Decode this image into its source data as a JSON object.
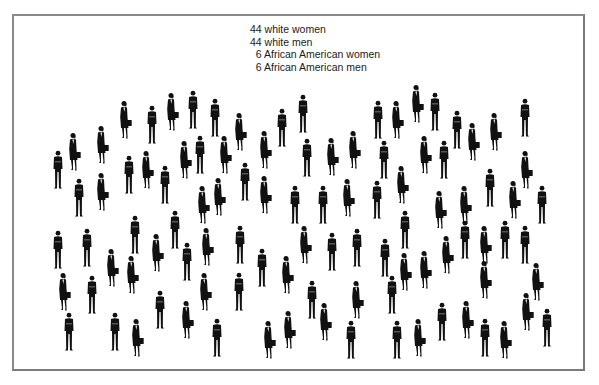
{
  "legend": {
    "lines": [
      "44 white women",
      "44 white men",
      "  6 African American women",
      "  6 African American men"
    ]
  },
  "colors": {
    "figure": "#111111",
    "frame": "#808080",
    "background": "#ffffff",
    "text": "#1a1a1a"
  },
  "figures": [
    {
      "x": 51,
      "y": 150,
      "t": "m"
    },
    {
      "x": 67,
      "y": 132,
      "t": "w"
    },
    {
      "x": 72,
      "y": 178,
      "t": "m"
    },
    {
      "x": 95,
      "y": 125,
      "t": "w"
    },
    {
      "x": 95,
      "y": 172,
      "t": "w"
    },
    {
      "x": 118,
      "y": 100,
      "t": "w"
    },
    {
      "x": 122,
      "y": 155,
      "t": "m"
    },
    {
      "x": 140,
      "y": 150,
      "t": "w"
    },
    {
      "x": 145,
      "y": 105,
      "t": "m"
    },
    {
      "x": 158,
      "y": 165,
      "t": "m"
    },
    {
      "x": 165,
      "y": 92,
      "t": "w"
    },
    {
      "x": 178,
      "y": 140,
      "t": "w"
    },
    {
      "x": 186,
      "y": 90,
      "t": "m"
    },
    {
      "x": 193,
      "y": 135,
      "t": "m"
    },
    {
      "x": 208,
      "y": 98,
      "t": "m"
    },
    {
      "x": 218,
      "y": 135,
      "t": "w"
    },
    {
      "x": 233,
      "y": 112,
      "t": "w"
    },
    {
      "x": 238,
      "y": 162,
      "t": "m"
    },
    {
      "x": 258,
      "y": 130,
      "t": "w"
    },
    {
      "x": 275,
      "y": 108,
      "t": "m"
    },
    {
      "x": 296,
      "y": 94,
      "t": "m"
    },
    {
      "x": 300,
      "y": 138,
      "t": "m"
    },
    {
      "x": 325,
      "y": 137,
      "t": "w"
    },
    {
      "x": 347,
      "y": 130,
      "t": "w"
    },
    {
      "x": 371,
      "y": 100,
      "t": "m"
    },
    {
      "x": 377,
      "y": 140,
      "t": "m"
    },
    {
      "x": 390,
      "y": 100,
      "t": "w"
    },
    {
      "x": 410,
      "y": 84,
      "t": "w"
    },
    {
      "x": 428,
      "y": 92,
      "t": "m"
    },
    {
      "x": 450,
      "y": 110,
      "t": "m"
    },
    {
      "x": 466,
      "y": 122,
      "t": "w"
    },
    {
      "x": 488,
      "y": 112,
      "t": "w"
    },
    {
      "x": 518,
      "y": 98,
      "t": "m"
    },
    {
      "x": 418,
      "y": 135,
      "t": "w"
    },
    {
      "x": 437,
      "y": 140,
      "t": "m"
    },
    {
      "x": 196,
      "y": 185,
      "t": "w"
    },
    {
      "x": 212,
      "y": 177,
      "t": "w"
    },
    {
      "x": 258,
      "y": 175,
      "t": "w"
    },
    {
      "x": 288,
      "y": 185,
      "t": "m"
    },
    {
      "x": 316,
      "y": 185,
      "t": "m"
    },
    {
      "x": 341,
      "y": 178,
      "t": "w"
    },
    {
      "x": 370,
      "y": 180,
      "t": "m"
    },
    {
      "x": 395,
      "y": 165,
      "t": "w"
    },
    {
      "x": 433,
      "y": 190,
      "t": "w"
    },
    {
      "x": 458,
      "y": 185,
      "t": "w"
    },
    {
      "x": 483,
      "y": 168,
      "t": "m"
    },
    {
      "x": 507,
      "y": 180,
      "t": "w"
    },
    {
      "x": 519,
      "y": 150,
      "t": "w"
    },
    {
      "x": 535,
      "y": 185,
      "t": "m"
    },
    {
      "x": 398,
      "y": 210,
      "t": "m"
    },
    {
      "x": 51,
      "y": 230,
      "t": "m"
    },
    {
      "x": 80,
      "y": 228,
      "t": "m"
    },
    {
      "x": 105,
      "y": 248,
      "t": "w"
    },
    {
      "x": 125,
      "y": 255,
      "t": "w"
    },
    {
      "x": 128,
      "y": 215,
      "t": "m"
    },
    {
      "x": 150,
      "y": 233,
      "t": "w"
    },
    {
      "x": 168,
      "y": 210,
      "t": "m"
    },
    {
      "x": 180,
      "y": 242,
      "t": "m"
    },
    {
      "x": 200,
      "y": 227,
      "t": "w"
    },
    {
      "x": 233,
      "y": 225,
      "t": "m"
    },
    {
      "x": 255,
      "y": 248,
      "t": "m"
    },
    {
      "x": 280,
      "y": 255,
      "t": "w"
    },
    {
      "x": 298,
      "y": 225,
      "t": "w"
    },
    {
      "x": 325,
      "y": 232,
      "t": "m"
    },
    {
      "x": 350,
      "y": 228,
      "t": "m"
    },
    {
      "x": 378,
      "y": 238,
      "t": "m"
    },
    {
      "x": 398,
      "y": 252,
      "t": "w"
    },
    {
      "x": 418,
      "y": 250,
      "t": "w"
    },
    {
      "x": 440,
      "y": 235,
      "t": "w"
    },
    {
      "x": 458,
      "y": 220,
      "t": "m"
    },
    {
      "x": 478,
      "y": 225,
      "t": "w"
    },
    {
      "x": 498,
      "y": 220,
      "t": "m"
    },
    {
      "x": 518,
      "y": 225,
      "t": "m"
    },
    {
      "x": 530,
      "y": 262,
      "t": "w"
    },
    {
      "x": 478,
      "y": 260,
      "t": "w"
    },
    {
      "x": 57,
      "y": 272,
      "t": "w"
    },
    {
      "x": 62,
      "y": 312,
      "t": "m"
    },
    {
      "x": 85,
      "y": 275,
      "t": "m"
    },
    {
      "x": 108,
      "y": 312,
      "t": "m"
    },
    {
      "x": 130,
      "y": 318,
      "t": "w"
    },
    {
      "x": 153,
      "y": 290,
      "t": "m"
    },
    {
      "x": 180,
      "y": 300,
      "t": "w"
    },
    {
      "x": 198,
      "y": 272,
      "t": "w"
    },
    {
      "x": 210,
      "y": 318,
      "t": "m"
    },
    {
      "x": 232,
      "y": 272,
      "t": "m"
    },
    {
      "x": 262,
      "y": 320,
      "t": "w"
    },
    {
      "x": 282,
      "y": 310,
      "t": "w"
    },
    {
      "x": 305,
      "y": 280,
      "t": "m"
    },
    {
      "x": 318,
      "y": 302,
      "t": "w"
    },
    {
      "x": 344,
      "y": 320,
      "t": "m"
    },
    {
      "x": 350,
      "y": 280,
      "t": "w"
    },
    {
      "x": 385,
      "y": 275,
      "t": "m"
    },
    {
      "x": 390,
      "y": 320,
      "t": "m"
    },
    {
      "x": 412,
      "y": 318,
      "t": "w"
    },
    {
      "x": 435,
      "y": 302,
      "t": "m"
    },
    {
      "x": 460,
      "y": 300,
      "t": "w"
    },
    {
      "x": 478,
      "y": 318,
      "t": "m"
    },
    {
      "x": 498,
      "y": 320,
      "t": "w"
    },
    {
      "x": 520,
      "y": 292,
      "t": "w"
    },
    {
      "x": 540,
      "y": 308,
      "t": "m"
    }
  ]
}
